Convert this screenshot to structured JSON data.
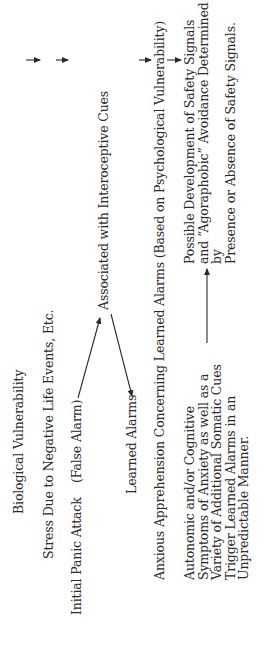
{
  "diagram": {
    "title": "",
    "orientation": "rotated-90-ccw",
    "nodes": {
      "biological_vulnerability": "Biological Vulnerability",
      "stress": "Stress Due to Negative Life Events, Etc.",
      "initial_panic_attack": "Initial Panic Attack",
      "false_alarm": "(False Alarm)",
      "associated_interoceptive": "Associated with Interoceptive Cues",
      "learned_alarms": "Learned Alarms",
      "anxious_apprehension": "Anxious Apprehension Concerning Learned Alarms (Based on Psychological Vulnerability)",
      "autonomic_symptoms": "Autonomic and/or Cognitive\nSymptoms of Anxiety as well as a\nVariety of Additional Somatic Cues\nTrigger Learned Alarms in an\nUnpredictable Manner.",
      "safety_signals": "Possible Development of Safety Signals\nand “Agoraphobic” Avoidance Determined by\nPresence or Absence of Safety Signals."
    },
    "edges": [
      {
        "from": "biological_vulnerability",
        "to": "stress"
      },
      {
        "from": "stress",
        "to": "false_alarm"
      },
      {
        "from": "false_alarm",
        "to": "associated_interoceptive"
      },
      {
        "from": "associated_interoceptive",
        "to": "learned_alarms"
      },
      {
        "from": "learned_alarms",
        "to": "anxious_apprehension"
      },
      {
        "from": "anxious_apprehension",
        "to": "autonomic_symptoms"
      },
      {
        "from": "autonomic_symptoms",
        "to": "safety_signals"
      }
    ],
    "colors": {
      "text": "#2a2a2a",
      "lines": "#2a2a2a",
      "background": "#ffffff"
    }
  }
}
